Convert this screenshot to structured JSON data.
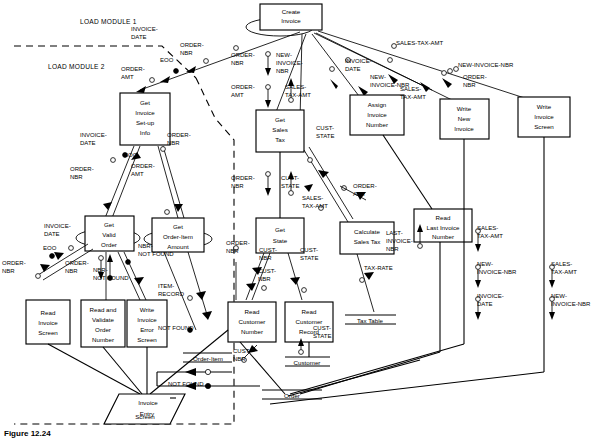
{
  "figure": {
    "caption_number": "Figure 12.24",
    "caption_text": ""
  },
  "annotations": {
    "load_module_1": "LOAD MODULE 1",
    "load_module_2": "LOAD MODULE 2"
  },
  "modules": [
    {
      "id": "create-invoice",
      "label": [
        "Create",
        "Invoice"
      ]
    },
    {
      "id": "get-invoice-setup-info",
      "label": [
        "Get",
        "Invoice",
        "Set-up",
        "Info"
      ]
    },
    {
      "id": "get-sales-tax",
      "label": [
        "Get",
        "Sales",
        "Tax"
      ]
    },
    {
      "id": "assign-invoice-number",
      "label": [
        "Assign",
        "Invoice",
        "Number"
      ]
    },
    {
      "id": "write-new-invoice",
      "label": [
        "Write",
        "New",
        "Invoice"
      ]
    },
    {
      "id": "write-invoice-screen",
      "label": [
        "Write",
        "Invoice",
        "Screen"
      ]
    },
    {
      "id": "get-valid-order",
      "label": [
        "Get",
        "Valid",
        "Order"
      ]
    },
    {
      "id": "get-order-item-amount",
      "label": [
        "Get",
        "Order-Item",
        "Amount"
      ]
    },
    {
      "id": "get-state",
      "label": [
        "Get",
        "State"
      ]
    },
    {
      "id": "calculate-sales-tax",
      "label": [
        "Calculate",
        "Sales Tax"
      ]
    },
    {
      "id": "read-last-invoice-number",
      "label": [
        "Read",
        "Last Invoice",
        "Number"
      ]
    },
    {
      "id": "read-invoice-screen",
      "label": [
        "Read",
        "Invoice",
        "Screen"
      ]
    },
    {
      "id": "read-and-validate-order-number",
      "label": [
        "Read and",
        "Validate",
        "Order",
        "Number"
      ]
    },
    {
      "id": "write-invoice-error-screen",
      "label": [
        "Write",
        "Invoice",
        "Error",
        "Screen"
      ]
    },
    {
      "id": "read-customer-number",
      "label": [
        "Read",
        "Customer",
        "Number"
      ]
    },
    {
      "id": "read-customer-record",
      "label": [
        "Read",
        "Customer",
        "Record"
      ]
    }
  ],
  "data_stores": [
    {
      "id": "tax-table",
      "label": "Tax Table"
    },
    {
      "id": "order-item",
      "label": "Order-Item"
    },
    {
      "id": "customer",
      "label": "Customer"
    },
    {
      "id": "order",
      "label": "Order"
    }
  ],
  "io_shape": {
    "id": "invoice-entry-screen",
    "line1": "Invoice",
    "line2": "Entry",
    "line3": "Screen"
  },
  "couples": {
    "invoice_date": "INVOICE-\nDATE",
    "order_nbr": "ORDER-\nNBR",
    "order_amt": "ORDER-\nAMT",
    "eoo": "EOO",
    "new_invoice_nbr": "NEW-\nINVOICE-\nNBR",
    "sales_tax_amt": "SALES-\nTAX-AMT",
    "cust_state": "CUST-\nSTATE",
    "cust_nbr": "CUST-\nNBR",
    "tax_rate": "TAX-RATE",
    "last_invoice_nbr": "LAST-\nINVOICE-\nNBR",
    "nbr_not_found": "NBR-\nNOT FOUND",
    "item_record": "ITEM-\nRECORD",
    "not_found": "NOT FOUND",
    "sales_tax_amt_flat": "SALES-TAX-AMT",
    "new_invoice_nbr_flat": "NEW-INVOICE-NBR"
  },
  "couple_labels": [
    {
      "id": "l-invoice-date-1",
      "text": [
        "INVOICE-",
        "DATE"
      ],
      "x": 131,
      "y": 31
    },
    {
      "id": "l-order-nbr-1",
      "text": [
        "ORDER-",
        "NBR"
      ],
      "x": 180,
      "y": 47
    },
    {
      "id": "l-eoo-1",
      "text": [
        "EOO"
      ],
      "x": 160,
      "y": 62
    },
    {
      "id": "l-order-amt-1",
      "text": [
        "ORDER-",
        "AMT"
      ],
      "x": 121,
      "y": 71
    },
    {
      "id": "l-order-nbr-2",
      "text": [
        "ORDER-",
        "NBR"
      ],
      "x": 231,
      "y": 57
    },
    {
      "id": "l-order-amt-2",
      "text": [
        "ORDER-",
        "AMT"
      ],
      "x": 231,
      "y": 89
    },
    {
      "id": "l-new-invoice-nbr-1",
      "text": [
        "NEW-",
        "INVOICE-",
        "NBR"
      ],
      "x": 276,
      "y": 57
    },
    {
      "id": "l-sales-tax-amt-1",
      "text": [
        "SALES-",
        "TAX-AMT"
      ],
      "x": 285,
      "y": 89
    },
    {
      "id": "l-invoice-date-2",
      "text": [
        "INVOICE-",
        "DATE"
      ],
      "x": 345,
      "y": 63
    },
    {
      "id": "l-new-invoice-nbr-2",
      "text": [
        "NEW-",
        "INVOICE-NBR"
      ],
      "x": 370,
      "y": 79
    },
    {
      "id": "l-sales-tax-amt-2",
      "text": [
        "SALES-",
        "TAX-AMT"
      ],
      "x": 400,
      "y": 91
    },
    {
      "id": "l-order-nbr-3",
      "text": [
        "ORDER-",
        "NBR"
      ],
      "x": 463,
      "y": 79
    },
    {
      "id": "l-sales-tax-amt-top",
      "text": [
        "SALES-TAX-AMT"
      ],
      "x": 396,
      "y": 45
    },
    {
      "id": "l-new-invoice-nbr-top",
      "text": [
        "NEW-INVOICE-NBR"
      ],
      "x": 458,
      "y": 67
    },
    {
      "id": "l-invoice-date-3",
      "text": [
        "INVOICE-",
        "DATE"
      ],
      "x": 80,
      "y": 137
    },
    {
      "id": "l-order-nbr-4",
      "text": [
        "ORDER-",
        "NBR"
      ],
      "x": 167,
      "y": 137
    },
    {
      "id": "l-eoo-2",
      "text": [
        "EOO"
      ],
      "x": 124,
      "y": 157
    },
    {
      "id": "l-order-nbr-5",
      "text": [
        "ORDER-",
        "NBR"
      ],
      "x": 70,
      "y": 171
    },
    {
      "id": "l-order-amt-3",
      "text": [
        "ORDER-",
        "AMT"
      ],
      "x": 131,
      "y": 168
    },
    {
      "id": "l-order-nbr-6",
      "text": [
        "ORDER-",
        "NBR"
      ],
      "x": 231,
      "y": 180
    },
    {
      "id": "l-cust-state-1",
      "text": [
        "CUST-",
        "STATE"
      ],
      "x": 281,
      "y": 180
    },
    {
      "id": "l-cust-state-2",
      "text": [
        "CUST-",
        "STATE"
      ],
      "x": 316,
      "y": 130
    },
    {
      "id": "l-sales-tax-amt-3",
      "text": [
        "SALES-",
        "TAX-AMT"
      ],
      "x": 302,
      "y": 200
    },
    {
      "id": "l-order-amt-4",
      "text": [
        "ORDER-",
        "AMT"
      ],
      "x": 353,
      "y": 188
    },
    {
      "id": "l-invoice-date-4",
      "text": [
        "INVOICE-",
        "DATE"
      ],
      "x": 44,
      "y": 228
    },
    {
      "id": "l-eoo-3",
      "text": [
        "EOO"
      ],
      "x": 43,
      "y": 250
    },
    {
      "id": "l-order-nbr-7",
      "text": [
        "ORDER-",
        "NBR"
      ],
      "x": 2,
      "y": 265
    },
    {
      "id": "l-order-nbr-8",
      "text": [
        "ORDER-",
        "NBR"
      ],
      "x": 65,
      "y": 265
    },
    {
      "id": "l-nbr-not-found-1",
      "text": [
        "NBR-",
        "NOT FOUND"
      ],
      "x": 93,
      "y": 272
    },
    {
      "id": "l-nbr-not-found-2",
      "text": [
        "NBR-",
        "NOT FOUND"
      ],
      "x": 138,
      "y": 248
    },
    {
      "id": "l-item-record",
      "text": [
        "ITEM-",
        "RECORD"
      ],
      "x": 158,
      "y": 288
    },
    {
      "id": "l-not-found-1",
      "text": [
        "NOT FOUND"
      ],
      "x": 158,
      "y": 330
    },
    {
      "id": "l-order-nbr-9",
      "text": [
        "ORDER-",
        "NBR"
      ],
      "x": 226,
      "y": 245
    },
    {
      "id": "l-cust-nbr-1",
      "text": [
        "CUST-",
        "NBR"
      ],
      "x": 259,
      "y": 252
    },
    {
      "id": "l-cust-nbr-2",
      "text": [
        "CUST-",
        "NBR"
      ],
      "x": 258,
      "y": 273
    },
    {
      "id": "l-cust-state-3",
      "text": [
        "CUST-",
        "STATE"
      ],
      "x": 300,
      "y": 252
    },
    {
      "id": "l-tax-rate",
      "text": [
        "TAX-RATE"
      ],
      "x": 364,
      "y": 270
    },
    {
      "id": "l-cust-state-4",
      "text": [
        "CUST-",
        "STATE"
      ],
      "x": 313,
      "y": 330
    },
    {
      "id": "l-cust-nbr-3",
      "text": [
        "CUST-",
        "NBR"
      ],
      "x": 233,
      "y": 353
    },
    {
      "id": "l-not-found-2",
      "text": [
        "NOT FOUND"
      ],
      "x": 168,
      "y": 386
    },
    {
      "id": "l-last-invoice-nbr",
      "text": [
        "LAST-",
        "INVOICE-",
        "NBR"
      ],
      "x": 386,
      "y": 235
    },
    {
      "id": "l-sales-tax-amt-4",
      "text": [
        "SALES-",
        "TAX-AMT"
      ],
      "x": 477,
      "y": 230
    },
    {
      "id": "l-new-invoice-nbr-3",
      "text": [
        "NEW-",
        "INVOICE-NBR"
      ],
      "x": 477,
      "y": 266
    },
    {
      "id": "l-invoice-date-5",
      "text": [
        "INVOICE-",
        "DATE"
      ],
      "x": 477,
      "y": 298
    },
    {
      "id": "l-sales-tax-amt-5",
      "text": [
        "SALES-",
        "TAX-AMT"
      ],
      "x": 551,
      "y": 266
    },
    {
      "id": "l-new-invoice-nbr-4",
      "text": [
        "NEW-",
        "INVOICE-NBR"
      ],
      "x": 551,
      "y": 298
    }
  ]
}
